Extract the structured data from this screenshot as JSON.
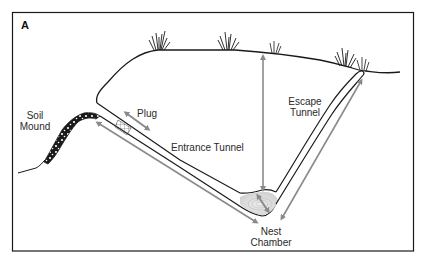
{
  "figure": {
    "panel_letter": "A",
    "colors": {
      "frame": "#1a1a1a",
      "ground_line": "#1a1a1a",
      "tunnel_line": "#1a1a1a",
      "arrow": "#8a8a8a",
      "grass": "#1a1a1a",
      "nest_fill": "#d8d8d8"
    },
    "labels": {
      "soil_mound_line1": "Soil",
      "soil_mound_line2": "Mound",
      "plug": "Plug",
      "entrance_tunnel": "Entrance Tunnel",
      "escape_tunnel_line1": "Escape",
      "escape_tunnel_line2": "Tunnel",
      "nest_chamber_line1": "Nest",
      "nest_chamber_line2": "Chamber"
    }
  }
}
